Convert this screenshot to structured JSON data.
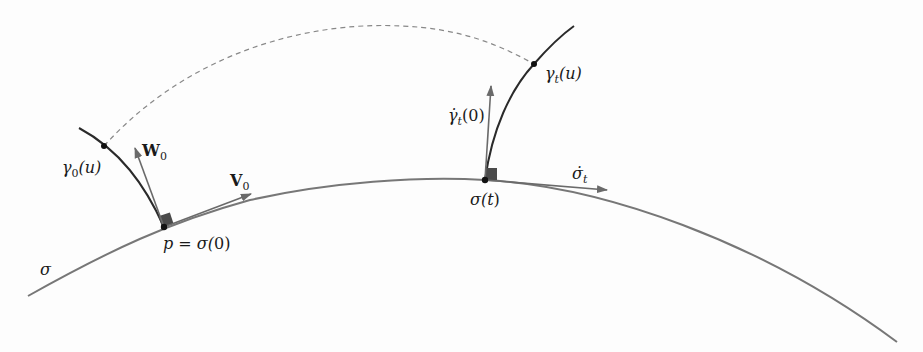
{
  "figure": {
    "colors": {
      "curve_sigma": "#777777",
      "geodesic": "#2a2a2a",
      "vector": "#6a6a6a",
      "dashed": "#888888",
      "point": "#111111",
      "right_angle_marker": "#555555"
    },
    "labels": {
      "sigma": "σ",
      "p_eq": "p = σ(",
      "p_zero": "0",
      "p_close": ")",
      "sigma_t": "σ(",
      "sigma_t_arg": "t",
      "sigma_t_close": ")",
      "gamma0": "γ",
      "gamma0_sub": "0",
      "gamma0_arg": "(u)",
      "W0": "W",
      "W0_sub": "0",
      "V0": "V",
      "V0_sub": "0",
      "gammat": "γ",
      "gammat_sub": "t",
      "gammat_arg": "(u)",
      "gammadot": "γ̇",
      "gammadot_sub": "t",
      "gammadot_arg": "(0)",
      "sigmadot": "σ̇",
      "sigmadot_sub": "t"
    }
  }
}
